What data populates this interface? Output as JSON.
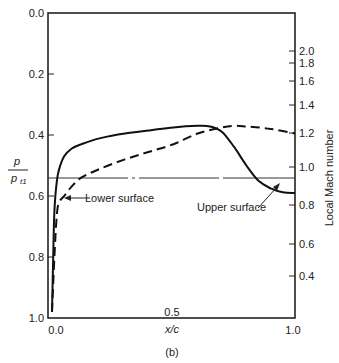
{
  "figure": {
    "caption": "(b)",
    "xlabel": "x/c",
    "ylabel_left_num": "p",
    "ylabel_left_den": "p",
    "ylabel_left_den_sub": "t1",
    "ylabel_right": "Local Mach number",
    "annotations": {
      "lower": "Lower surface",
      "upper": "Upper surface"
    }
  },
  "chart_data": {
    "type": "line",
    "title": "",
    "xlabel": "x/c",
    "ylabel": "p / p_t1",
    "ylabel_right": "Local Mach number",
    "xlim": [
      0.0,
      1.0
    ],
    "ylim": [
      1.0,
      0.0
    ],
    "y_inverted": true,
    "grid": false,
    "x_ticks": [
      "0.0",
      "0.5",
      "1.0"
    ],
    "y_ticks_left": [
      "0.0",
      "0.2",
      "0.4",
      "0.6",
      "0.8",
      "1.0"
    ],
    "y_ticks_right": [
      "2.0",
      "1.8",
      "1.6",
      "1.4",
      "1.2",
      "1.0",
      "0.8",
      "0.6",
      "0.4"
    ],
    "reference_lines": [
      {
        "name": "sonic line (M = 1.0)",
        "y": 0.54,
        "style": "dash-dot"
      }
    ],
    "series": [
      {
        "name": "Upper surface",
        "style": "solid",
        "x": [
          0.0,
          0.005,
          0.01,
          0.02,
          0.03,
          0.05,
          0.08,
          0.12,
          0.2,
          0.3,
          0.4,
          0.5,
          0.6,
          0.65,
          0.7,
          0.75,
          0.8,
          0.85,
          0.9,
          0.95,
          1.0
        ],
        "y": [
          0.98,
          0.8,
          0.65,
          0.55,
          0.51,
          0.47,
          0.445,
          0.43,
          0.41,
          0.395,
          0.385,
          0.375,
          0.37,
          0.372,
          0.39,
          0.44,
          0.5,
          0.55,
          0.575,
          0.588,
          0.59
        ]
      },
      {
        "name": "Lower surface",
        "style": "dashed",
        "x": [
          0.0,
          0.01,
          0.02,
          0.03,
          0.05,
          0.08,
          0.12,
          0.2,
          0.3,
          0.4,
          0.5,
          0.6,
          0.7,
          0.75,
          0.8,
          0.9,
          1.0
        ],
        "y": [
          0.98,
          0.8,
          0.66,
          0.62,
          0.6,
          0.57,
          0.54,
          0.51,
          0.48,
          0.455,
          0.43,
          0.395,
          0.375,
          0.37,
          0.372,
          0.38,
          0.395
        ]
      }
    ]
  }
}
